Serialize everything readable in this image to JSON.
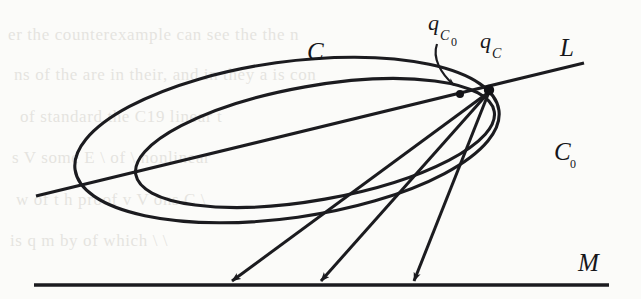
{
  "figure": {
    "background_color": "#fbfbf9",
    "ink_color": "#1b1b1f",
    "labels": {
      "outer_curve": "C",
      "inner_curve": "C",
      "inner_curve_subscript": "0",
      "line_l": "L",
      "line_m": "M",
      "point_qc": "q",
      "point_qc_subscript": "C",
      "point_qc0": "q",
      "point_qc0_subscript": "C",
      "point_qc0_subsubscript": "0"
    },
    "geometry": {
      "outer_ellipse": {
        "name": "C",
        "center_x": 287,
        "center_y": 140,
        "radius_x": 214,
        "radius_y": 78,
        "rotation_deg": -8
      },
      "inner_ellipse": {
        "name": "C0",
        "center_x": 315,
        "center_y": 143,
        "radius_x": 182,
        "radius_y": 57,
        "rotation_deg": -10
      },
      "line_l": {
        "name": "L",
        "x1": 36,
        "y1": 196,
        "x2": 584,
        "y2": 63
      },
      "line_m": {
        "name": "M",
        "x1": 34,
        "y1": 285,
        "x2": 609,
        "y2": 285
      },
      "node_qc": {
        "x": 489,
        "y": 90,
        "radius": 5.2
      },
      "node_qc0": {
        "x": 460,
        "y": 94,
        "radius": 4.0
      },
      "rays": [
        {
          "from_x": 489,
          "from_y": 92,
          "to_x": 226,
          "to_y": 285
        },
        {
          "from_x": 489,
          "from_y": 92,
          "to_x": 316,
          "to_y": 285
        },
        {
          "from_x": 489,
          "from_y": 92,
          "to_x": 411,
          "to_y": 285
        }
      ],
      "pointer_arrow": {
        "from_x": 437,
        "from_y": 44,
        "to_x": 458,
        "to_y": 88
      }
    },
    "ghost_lines": [
      "er the counterexample can see the  the n",
      "ns of the are in their, and in they a is con",
      "of   standard  the C19  linear  t",
      "s   V   some    E   \\   of    \\   nonlinear",
      "w   of  t  h  proof   v   V   ons   C   \\",
      "is   q   m  by   of   which   \\   \\"
    ]
  }
}
